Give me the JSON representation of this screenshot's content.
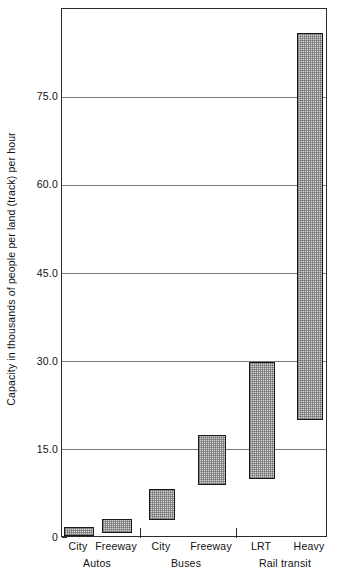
{
  "chart_data": {
    "type": "bar",
    "subtype": "floating-range-bar",
    "title": "",
    "xlabel": "",
    "ylabel": "Capacity in thousands of people per land (track) per hour",
    "ylim": [
      0,
      90
    ],
    "yticks": [
      0,
      15,
      30,
      45,
      60,
      75
    ],
    "ytick_labels": [
      "0",
      "15.0",
      "30.0",
      "45.0",
      "60.0",
      "75.0"
    ],
    "grid": true,
    "legend": "none",
    "categories": [
      "City",
      "Freeway",
      "City",
      "Freeway",
      "LRT",
      "Heavy"
    ],
    "groups": [
      {
        "label": "Autos",
        "categories": [
          "City",
          "Freeway"
        ]
      },
      {
        "label": "Buses",
        "categories": [
          "City",
          "Freeway"
        ]
      },
      {
        "label": "Rail transit",
        "categories": [
          "LRT",
          "Heavy"
        ]
      }
    ],
    "series": [
      {
        "name": "low",
        "values": [
          0.3,
          0.8,
          3.0,
          9.0,
          10.0,
          20.0
        ]
      },
      {
        "name": "high",
        "values": [
          1.8,
          3.3,
          8.3,
          17.6,
          30.0,
          86.0
        ]
      }
    ],
    "bars": [
      {
        "category": "City",
        "group": "Autos",
        "low": 0.3,
        "high": 1.8
      },
      {
        "category": "Freeway",
        "group": "Autos",
        "low": 0.8,
        "high": 3.3
      },
      {
        "category": "City",
        "group": "Buses",
        "low": 3.0,
        "high": 8.3
      },
      {
        "category": "Freeway",
        "group": "Buses",
        "low": 9.0,
        "high": 17.6
      },
      {
        "category": "LRT",
        "group": "Rail transit",
        "low": 10.0,
        "high": 30.0
      },
      {
        "category": "Heavy",
        "group": "Rail transit",
        "low": 20.0,
        "high": 86.0
      }
    ],
    "colors": {
      "bar_fill": "#d8d8d8",
      "bar_border": "#1a1a1a",
      "gridline": "#7a7a7a",
      "axis": "#2b2b2b",
      "background": "#ffffff"
    }
  }
}
